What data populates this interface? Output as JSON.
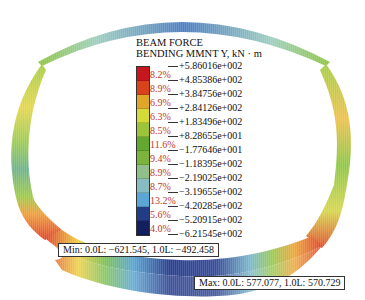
{
  "legend": {
    "title_line1": "BEAM FORCE",
    "title_line2": "BENDING MMNT Y, kN · m",
    "values": [
      "+5.86016e+002",
      "+4.85386e+002",
      "+3.84756e+002",
      "+2.84126e+002",
      "+1.83496e+002",
      "+8.28655e+001",
      "−1.77646e+001",
      "−1.18395e+002",
      "−2.19025e+002",
      "−3.19655e+002",
      "−4.20285e+002",
      "−5.20915e+002",
      "−6.21545e+002"
    ],
    "bins": [
      {
        "pct": "8.2%",
        "color": "#c8161e"
      },
      {
        "pct": "8.9%",
        "color": "#d9421b"
      },
      {
        "pct": "6.9%",
        "color": "#dfa728"
      },
      {
        "pct": "6.3%",
        "color": "#d2db38"
      },
      {
        "pct": "8.5%",
        "color": "#9cc43a"
      },
      {
        "pct": "11.6%",
        "color": "#64a830"
      },
      {
        "pct": "9.4%",
        "color": "#7cb33c"
      },
      {
        "pct": "8.9%",
        "color": "#8fbf8a"
      },
      {
        "pct": "8.7%",
        "color": "#88bcc3"
      },
      {
        "pct": "13.2%",
        "color": "#5aa6d6"
      },
      {
        "pct": "5.6%",
        "color": "#223d86"
      },
      {
        "pct": "4.0%",
        "color": "#141f5e"
      }
    ]
  },
  "callouts": {
    "min": "Min: 0.0L: −621.545, 1.0L: −492.458",
    "max": "Max: 0.0L: 577.077, 1.0L: 570.729"
  }
}
